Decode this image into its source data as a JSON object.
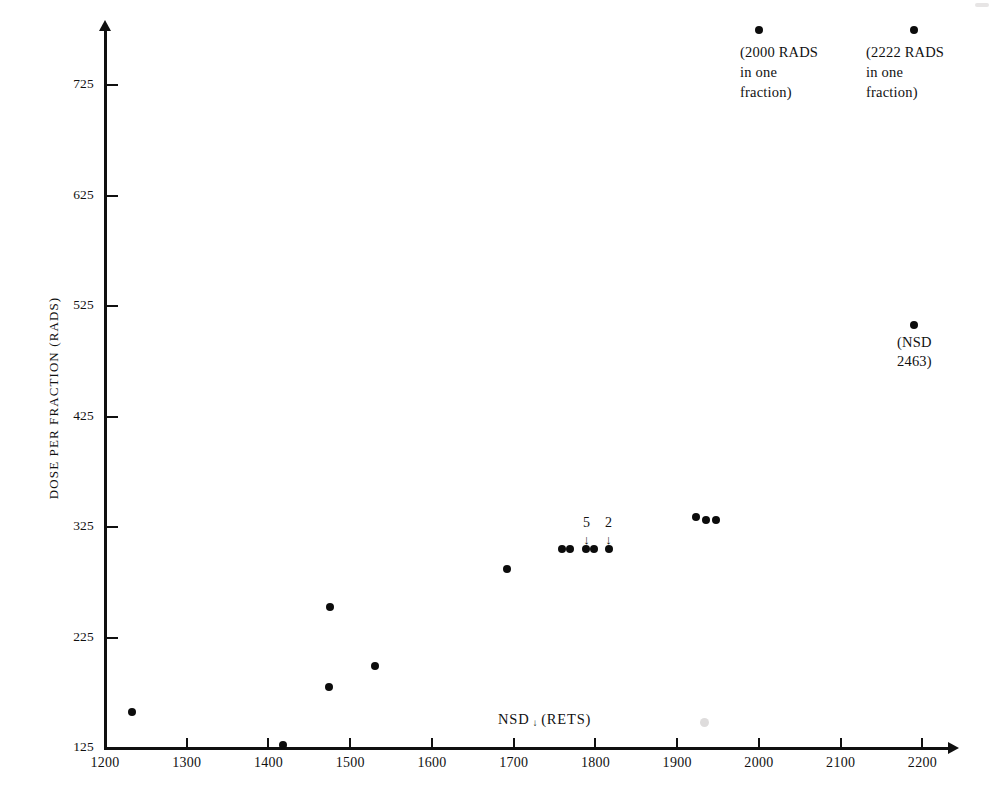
{
  "chart_data": {
    "type": "scatter",
    "title": "",
    "xlabel": "NSD (RETS)",
    "xlabel_parts": {
      "prefix": "NSD",
      "arrow": "↓",
      "suffix": "(RETS)"
    },
    "ylabel": "DOSE PER FRACTION (RADS)",
    "xlim": [
      1200,
      2230
    ],
    "ylim": [
      125,
      775
    ],
    "xticks": [
      1200,
      1300,
      1400,
      1500,
      1600,
      1700,
      1800,
      1900,
      2000,
      2100,
      2200
    ],
    "yticks": [
      125,
      225,
      325,
      425,
      525,
      625,
      725
    ],
    "grid": false,
    "legend": "none",
    "points": [
      {
        "x": 1233,
        "y": 158
      },
      {
        "x": 1418,
        "y": 128
      },
      {
        "x": 1475,
        "y": 253
      },
      {
        "x": 1474,
        "y": 180
      },
      {
        "x": 1530,
        "y": 199
      },
      {
        "x": 1692,
        "y": 287
      },
      {
        "x": 1759,
        "y": 305
      },
      {
        "x": 1769,
        "y": 305
      },
      {
        "x": 1789,
        "y": 305
      },
      {
        "x": 1798,
        "y": 305
      },
      {
        "x": 1816,
        "y": 305
      },
      {
        "x": 1923,
        "y": 334
      },
      {
        "x": 1935,
        "y": 331
      },
      {
        "x": 1947,
        "y": 331
      },
      {
        "x": 2000,
        "y": 775
      },
      {
        "x": 2190,
        "y": 775
      },
      {
        "x": 2190,
        "y": 508
      }
    ],
    "annotations": [
      {
        "id": "2000-rads",
        "text": "(2000 RADS\nin one\nfraction)",
        "near_x": 2000,
        "near_y": 775
      },
      {
        "id": "2222-rads",
        "text": "(2222 RADS\nin one\nfraction)",
        "near_x": 2190,
        "near_y": 775
      },
      {
        "id": "nsd-2463",
        "text": "(NSD\n2463)",
        "near_x": 2190,
        "near_y": 508
      }
    ],
    "cluster_labels": [
      {
        "id": "cluster-count-5",
        "label": "5",
        "arrow": "↓",
        "points_to_x": 1789
      },
      {
        "id": "cluster-count-2",
        "label": "2",
        "arrow": "↓",
        "points_to_x": 1816
      }
    ]
  },
  "axis": {
    "y_tick_labels": [
      "725",
      "625",
      "525",
      "425",
      "325",
      "225",
      "125"
    ],
    "x_tick_labels": [
      "1200",
      "1300",
      "1400",
      "1500",
      "1600",
      "1700",
      "1800",
      "1900",
      "2000",
      "2100",
      "2200"
    ],
    "y_title": "DOSE PER FRACTION (RADS)",
    "x_title_prefix": "NSD",
    "x_title_arrow": "↓",
    "x_title_suffix": "(RETS)"
  },
  "annotations": {
    "rads_2000": "(2000 RADS\nin one\nfraction)",
    "rads_2222": "(2222 RADS\nin one\nfraction)",
    "nsd_2463": "(NSD\n2463)",
    "cluster_5": "5",
    "cluster_2": "2",
    "arrow_glyph": "↓"
  },
  "colors": {
    "ink": "#101010",
    "point": "#0c0c0c",
    "background": "#ffffff"
  }
}
